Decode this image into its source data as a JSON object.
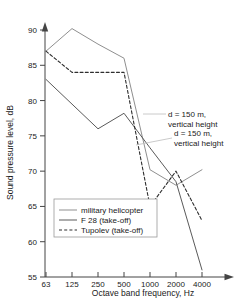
{
  "chart_data": {
    "type": "line",
    "title": "",
    "subtitle": "",
    "xlabel": "Octave band frequency, Hz",
    "ylabel": "Sound pressure level, dB",
    "x": [
      63,
      125,
      250,
      500,
      1000,
      2000,
      4000
    ],
    "xtick_labels": [
      "63",
      "125",
      "250",
      "500",
      "1000",
      "2000",
      "4000"
    ],
    "xscale": "log-octave",
    "ylim": [
      55,
      90
    ],
    "ytick_labels": [
      "55",
      "60",
      "65",
      "70",
      "75",
      "80",
      "85",
      "90"
    ],
    "yticks": [
      55,
      60,
      65,
      70,
      75,
      80,
      85,
      90
    ],
    "grid": false,
    "legend_position": "lower-left-inside",
    "series": [
      {
        "name": "military helicopter",
        "style": "solid",
        "color": "#8f8f8f",
        "values": [
          87.0,
          90.2,
          88.0,
          86.0,
          70.2,
          68.0,
          70.2
        ]
      },
      {
        "name": "F 28 (take-off)",
        "style": "solid",
        "color": "#5a5a5a",
        "values": [
          83.0,
          79.5,
          76.0,
          78.2,
          73.3,
          68.5,
          56.0
        ]
      },
      {
        "name": "Tupolev (take-off)",
        "style": "dashed",
        "color": "#2e2e2e",
        "values": [
          87.0,
          84.0,
          84.0,
          84.0,
          65.0,
          70.0,
          63.0
        ]
      }
    ],
    "annotations": [
      {
        "id": "annotation-upper",
        "line1": "d = 150 m,",
        "line2": "vertical height"
      },
      {
        "id": "annotation-lower",
        "line1": "d = 150 m,",
        "line2": "vertical height"
      }
    ]
  },
  "legend": {
    "entries": [
      {
        "label": "military helicopter"
      },
      {
        "label": "F 28 (take-off)"
      },
      {
        "label": "Tupolev (take-off)"
      }
    ]
  },
  "colors": {
    "axis": "#444444",
    "series_helicopter": "#8f8f8f",
    "series_f28": "#5a5a5a",
    "series_tupolev": "#2e2e2e",
    "background": "#ffffff"
  }
}
